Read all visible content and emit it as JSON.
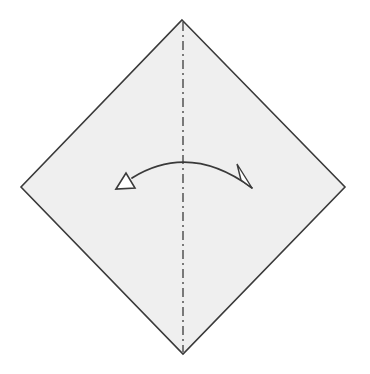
{
  "diagram": {
    "type": "origami-fold-step",
    "paper": {
      "shape": "square-rotated-45",
      "fill": "#efefef",
      "stroke": "#3a3a3a",
      "vertices": {
        "top": [
          182,
          20
        ],
        "right": [
          345,
          187
        ],
        "bottom": [
          183,
          354
        ],
        "left": [
          21,
          187
        ]
      }
    },
    "fold_line": {
      "style": "valley-dash-dot",
      "orientation": "vertical",
      "x": 183,
      "stroke": "#3a3a3a"
    },
    "arrow": {
      "meaning": "fold-and-unfold",
      "direction": "right-to-left",
      "stroke": "#3a3a3a"
    },
    "colors": {
      "background": "#ffffff",
      "paper": "#efefef",
      "line": "#3a3a3a"
    }
  }
}
